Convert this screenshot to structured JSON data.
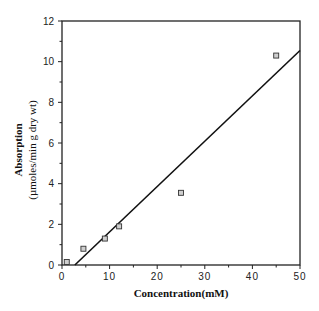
{
  "chart_data": {
    "type": "scatter",
    "title": "",
    "xlabel": "Concentration(mM)",
    "ylabel": "Absorption",
    "ylabel_units": "(µmoles/min g dry wt)",
    "xlim": [
      0,
      50
    ],
    "ylim": [
      0,
      12
    ],
    "xticks": [
      0,
      10,
      20,
      30,
      40,
      50
    ],
    "yticks": [
      0,
      2,
      4,
      6,
      8,
      10,
      12
    ],
    "x_minor_ticks": [
      5,
      15,
      25,
      35,
      45
    ],
    "y_minor_ticks": [
      1,
      3,
      5,
      7,
      9,
      11
    ],
    "grid": false,
    "legend": null,
    "series": [
      {
        "name": "measured",
        "marker": "open-square",
        "x": [
          1,
          4.5,
          9,
          12,
          25,
          45
        ],
        "y": [
          0.15,
          0.8,
          1.3,
          1.9,
          3.55,
          10.3
        ]
      }
    ],
    "fit_line": {
      "name": "linear fit",
      "x": [
        2.7,
        50
      ],
      "y": [
        0,
        10.55
      ]
    }
  }
}
